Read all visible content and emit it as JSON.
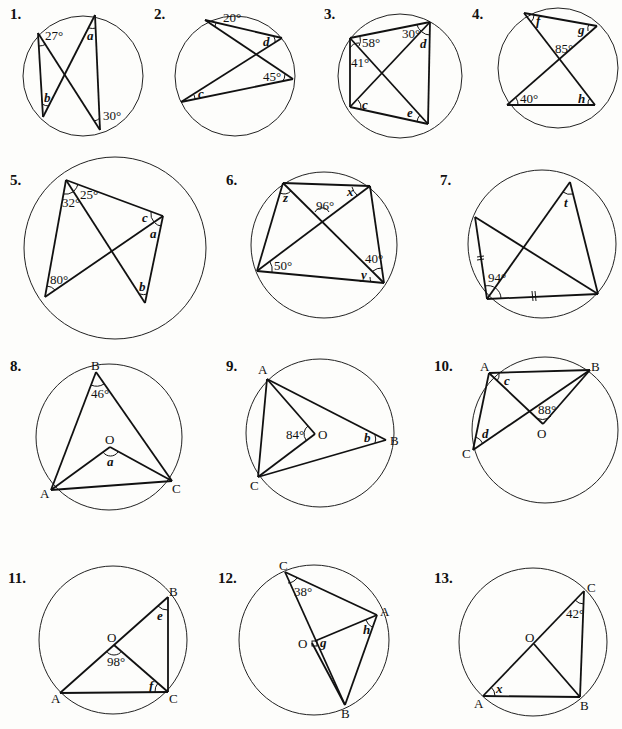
{
  "problems": [
    {
      "number": "1.",
      "labels": {
        "angle_top_left": "27°",
        "angle_top_right": "a",
        "angle_bottom_left": "b",
        "angle_bottom_right": "30°"
      }
    },
    {
      "number": "2.",
      "labels": {
        "angle_top": "20°",
        "angle_right_upper": "d",
        "angle_right_lower": "45°",
        "angle_left": "c"
      }
    },
    {
      "number": "3.",
      "labels": {
        "angle_tl_upper": "58°",
        "angle_tl_lower": "41°",
        "angle_tr_left": "30°",
        "angle_tr_right": "d",
        "angle_bl": "c",
        "angle_br": "e"
      }
    },
    {
      "number": "4.",
      "labels": {
        "angle_tl": "f",
        "angle_tr": "g",
        "angle_center": "85°",
        "angle_bl": "40°",
        "angle_br": "h"
      }
    },
    {
      "number": "5.",
      "labels": {
        "angle_top_left": "32°",
        "angle_top_right": "25°",
        "angle_right_upper": "c",
        "angle_right_lower": "a",
        "angle_bl": "80°",
        "angle_b": "b"
      }
    },
    {
      "number": "6.",
      "labels": {
        "angle_tl": "z",
        "angle_tr": "x",
        "angle_center": "96°",
        "angle_bl": "50°",
        "angle_br_upper": "40°",
        "angle_br_lower": "y"
      }
    },
    {
      "number": "7.",
      "labels": {
        "angle_top": "t",
        "angle_bl": "94°",
        "equal_mark_left": "=",
        "equal_mark_bottom": "//"
      }
    },
    {
      "number": "8.",
      "points": {
        "B": "B",
        "O": "O",
        "A": "A",
        "C": "C"
      },
      "labels": {
        "angle_B": "46°",
        "angle_O": "a"
      }
    },
    {
      "number": "9.",
      "points": {
        "A": "A",
        "O": "O",
        "B": "B",
        "C": "C"
      },
      "labels": {
        "angle_O": "84°",
        "angle_B": "b"
      }
    },
    {
      "number": "10.",
      "points": {
        "A": "A",
        "B": "B",
        "O": "O",
        "C": "C"
      },
      "labels": {
        "angle_A": "c",
        "angle_O": "88°",
        "angle_C": "d"
      }
    },
    {
      "number": "11.",
      "points": {
        "B": "B",
        "O": "O",
        "A": "A",
        "C": "C"
      },
      "labels": {
        "angle_B": "e",
        "angle_O": "98°",
        "angle_C": "f"
      }
    },
    {
      "number": "12.",
      "points": {
        "C": "C",
        "A": "A",
        "O": "O",
        "B": "B"
      },
      "labels": {
        "angle_C": "38°",
        "angle_A": "h",
        "angle_O": "g"
      }
    },
    {
      "number": "13.",
      "points": {
        "C": "C",
        "O": "O",
        "A": "A",
        "B": "B"
      },
      "labels": {
        "angle_C": "42°",
        "angle_A": "x"
      }
    }
  ]
}
